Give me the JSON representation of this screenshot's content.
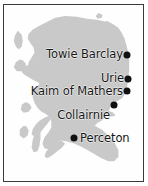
{
  "figure": {
    "kind": "locator-map",
    "region_name": "Scotland",
    "background_color": "#ffffff",
    "border_color": "#3a3a3a",
    "land_fill_color": "#c9c9c9",
    "sea_fill_color": "#fefefe",
    "marker_color": "#111111",
    "label_color": "#151515"
  },
  "map_data": {
    "type": "point-map",
    "title": "",
    "projection_note": "",
    "sites": [
      {
        "label": "Towie Barclay",
        "marker_x": 123,
        "marker_y": 50,
        "label_x": 119,
        "label_y": 49,
        "label_anchor": "right"
      },
      {
        "label": "Urie",
        "marker_x": 124,
        "marker_y": 74,
        "label_x": 120,
        "label_y": 73,
        "label_anchor": "right"
      },
      {
        "label": "Kaim of Mathers",
        "marker_x": 123,
        "marker_y": 86,
        "label_x": 119,
        "label_y": 86,
        "label_anchor": "right"
      },
      {
        "label": "Collairnie",
        "marker_x": 110,
        "marker_y": 100,
        "label_x": 106,
        "label_y": 110,
        "label_anchor": "right"
      },
      {
        "label": "Perceton",
        "marker_x": 70,
        "marker_y": 133,
        "label_x": 76,
        "label_y": 133,
        "label_anchor": "left"
      }
    ]
  }
}
